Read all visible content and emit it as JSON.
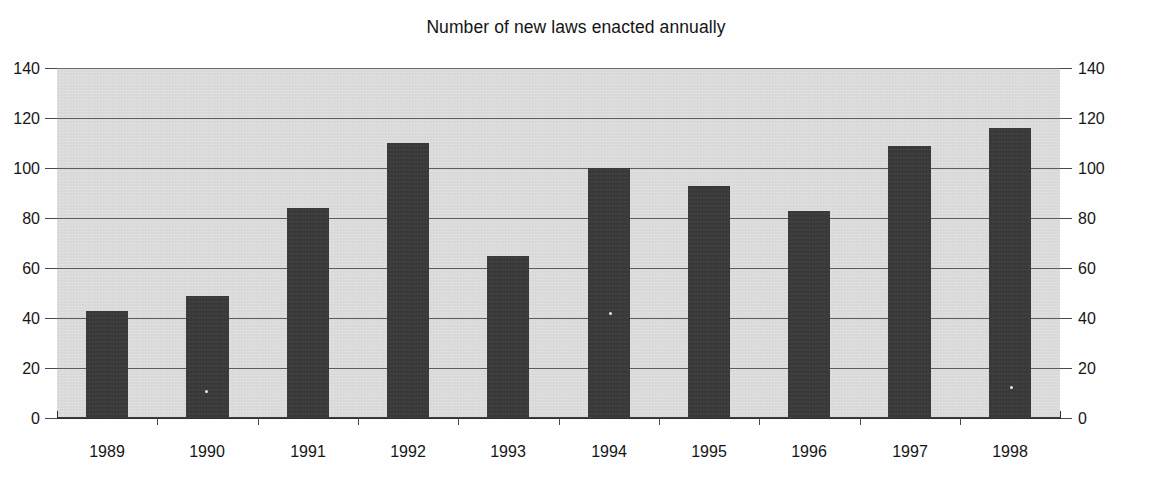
{
  "chart_data": {
    "type": "bar",
    "title": "Number of new laws enacted annually",
    "xlabel": "",
    "ylabel": "",
    "categories": [
      "1989",
      "1990",
      "1991",
      "1992",
      "1993",
      "1994",
      "1995",
      "1996",
      "1997",
      "1998"
    ],
    "values": [
      43,
      49,
      84,
      110,
      65,
      100,
      93,
      83,
      109,
      116
    ],
    "series": [
      {
        "name": "New laws enacted",
        "values": [
          43,
          49,
          84,
          110,
          65,
          100,
          93,
          83,
          109,
          116
        ]
      }
    ],
    "ylim": [
      0,
      140
    ],
    "ytick_values": [
      0,
      20,
      40,
      60,
      80,
      100,
      120,
      140
    ],
    "ytick_labels_left": [
      "0",
      "20",
      "40",
      "60",
      "80",
      "100",
      "120",
      "140"
    ],
    "ytick_labels_right": [
      "0",
      "20",
      "40",
      "60",
      "80",
      "100",
      "120",
      "140"
    ],
    "grid": true,
    "grid_axis": "y",
    "legend": false,
    "legend_position": "none",
    "bar_color": "#3a3a3a",
    "plot_background_color": "#dcdcdc",
    "figure_background_color": "#ffffff",
    "gridline_color": "#5c5c5c",
    "text_color": "#161616",
    "dual_y_axis": true
  }
}
